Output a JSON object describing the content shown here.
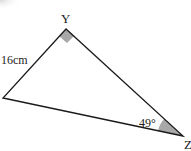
{
  "diagram": {
    "type": "right-triangle",
    "vertices": {
      "top": {
        "label": "Y",
        "x": 66,
        "y": 29
      },
      "left": {
        "label": "",
        "x": 3,
        "y": 98
      },
      "bottom_right": {
        "label": "Z",
        "x": 183,
        "y": 136
      }
    },
    "side_label": "16cm",
    "angle_label": "49°",
    "right_angle_at": "Y",
    "marker_color": "#a8a8a8",
    "line_color": "#1a1a1a"
  }
}
